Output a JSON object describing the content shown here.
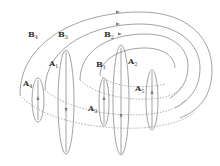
{
  "diagram": {
    "type": "field-lines-schematic",
    "labels": {
      "B4": {
        "main": "B",
        "sub": "4"
      },
      "B3": {
        "main": "B",
        "sub": "3"
      },
      "B2": {
        "main": "B",
        "sub": "2"
      },
      "B1": {
        "main": "B",
        "sub": "1"
      },
      "A1": {
        "main": "A",
        "sub": "1"
      },
      "A2": {
        "main": "A",
        "sub": "2"
      },
      "A3": {
        "main": "A",
        "sub": "3"
      },
      "A4": {
        "main": "A",
        "sub": "4"
      },
      "A5": {
        "main": "A",
        "sub": "5"
      }
    },
    "colors": {
      "line": "#8a8a8a",
      "dotted": "#9a9a9a",
      "text": "#333333"
    }
  }
}
